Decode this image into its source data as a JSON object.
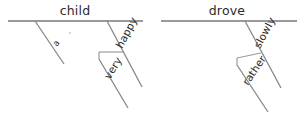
{
  "figure": {
    "kind": "sentence-diagram-pair",
    "background_color": "#ffffff",
    "line_color": "#77787a",
    "text_color": "#2b2b2b"
  },
  "diagrams": [
    {
      "id": "left",
      "headword": "child",
      "modifiers": [
        {
          "label": "a",
          "level": 1
        },
        {
          "label": "happy",
          "level": 1
        },
        {
          "label": "very",
          "level": 2
        }
      ]
    },
    {
      "id": "right",
      "headword": "drove",
      "modifiers": [
        {
          "label": "slowly",
          "level": 1
        },
        {
          "label": "rather",
          "level": 2
        }
      ]
    }
  ],
  "labels": {
    "left_head": "child",
    "left_mod_a": "a",
    "left_mod_happy": "happy",
    "left_mod_very": "very",
    "right_head": "drove",
    "right_mod_slowly": "slowly",
    "right_mod_rather": "rather"
  }
}
